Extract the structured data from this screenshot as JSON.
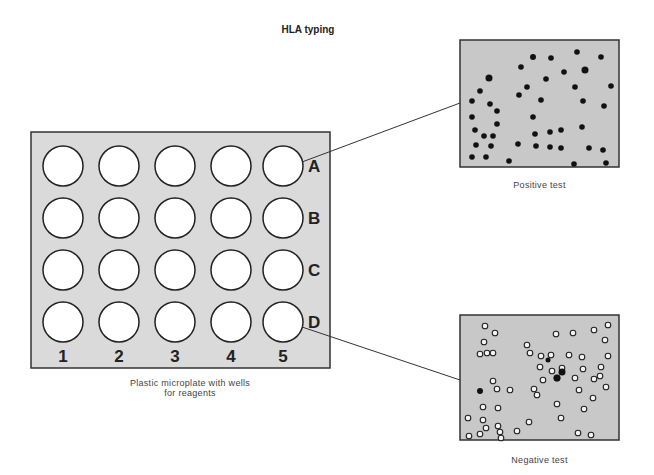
{
  "title": "HLA typing",
  "plate": {
    "caption_line1": "Plastic microplate with wells",
    "caption_line2": "for reagents",
    "rows": [
      "A",
      "B",
      "C",
      "D"
    ],
    "columns": [
      "1",
      "2",
      "3",
      "4",
      "5"
    ],
    "fill_color": "#d9d9d9",
    "well_color": "#ffffff"
  },
  "positive_panel": {
    "caption": "Positive test",
    "linked_well": "A5",
    "cell_style": "dark filled cells",
    "background": "#c8c8c8"
  },
  "negative_panel": {
    "caption": "Negative test",
    "linked_well": "D5",
    "cell_style": "mostly unstained ring cells with a few dark cells",
    "background": "#c8c8c8"
  }
}
